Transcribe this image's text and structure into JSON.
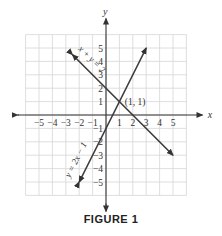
{
  "figure": {
    "caption": "FIGURE 1",
    "axis_labels": {
      "x": "x",
      "y": "y"
    },
    "x_ticks": [
      "−5",
      "−4",
      "−3",
      "−2",
      "−1",
      "1",
      "2",
      "3",
      "4",
      "5"
    ],
    "y_ticks": [
      "5",
      "4",
      "3",
      "2",
      "1",
      "−1",
      "−2",
      "−3",
      "−4",
      "−5"
    ],
    "intersection_label": "(1, 1)",
    "line1_label": "x + y = 2",
    "line2_label": "y = 2x − 1",
    "colors": {
      "grid": "#d6d6d6",
      "axes": "#333333",
      "lines": "#3a3a3a"
    }
  },
  "chart_data": {
    "type": "line",
    "title": "FIGURE 1",
    "xlabel": "x",
    "ylabel": "y",
    "xlim": [
      -6,
      6
    ],
    "ylim": [
      -6,
      6
    ],
    "grid": true,
    "series": [
      {
        "name": "x + y = 2",
        "equation": "y = -x + 2",
        "points": [
          [
            -2.5,
            4.5
          ],
          [
            5,
            -3
          ]
        ]
      },
      {
        "name": "y = 2x − 1",
        "equation": "y = 2x - 1",
        "points": [
          [
            -2,
            -5
          ],
          [
            3,
            5
          ]
        ]
      }
    ],
    "annotations": [
      {
        "text": "(1, 1)",
        "x": 1,
        "y": 1
      }
    ]
  }
}
